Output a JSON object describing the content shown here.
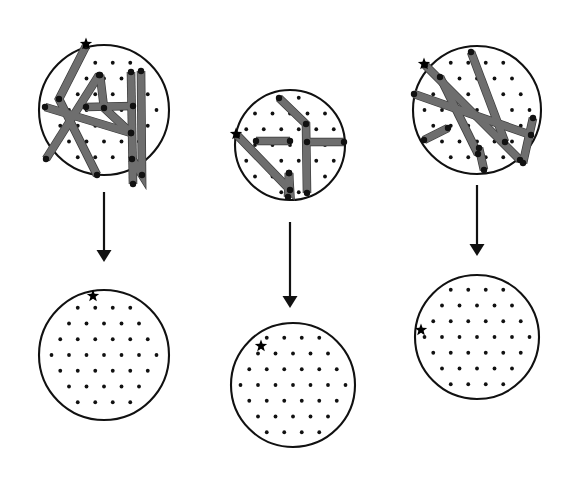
{
  "figure": {
    "title": "",
    "type": "diagram",
    "background_color": "#ffffff",
    "line_color": "#6e6e6e",
    "line_edge_color": "#3a3a3a",
    "dot_color": "#111111",
    "outline_color": "#111111",
    "star_color": "#000000"
  },
  "columns": [
    {
      "name": "column-1",
      "top": {
        "name": "panel-top-left",
        "circle": {
          "cx": 104,
          "cy": 110,
          "r": 65
        },
        "lattice": {
          "spacing": 17.5,
          "row_offset": 8.75,
          "dot_radius": 1.9,
          "origin_x": 104,
          "origin_y": 110
        },
        "star": {
          "x": 86,
          "y": 44,
          "size": 13
        },
        "paths": [
          {
            "name": "path-a",
            "points": [
              [
                86,
                46
              ],
              [
                59,
                99
              ],
              [
                97,
                175
              ]
            ]
          },
          {
            "name": "path-b",
            "points": [
              [
                45,
                107
              ],
              [
                131,
                133
              ]
            ]
          },
          {
            "name": "path-c",
            "points": [
              [
                46,
                159
              ],
              [
                99,
                75
              ]
            ]
          },
          {
            "name": "path-d",
            "points": [
              [
                100,
                75
              ],
              [
                104,
                108
              ],
              [
                131,
                133
              ]
            ]
          },
          {
            "name": "path-e",
            "points": [
              [
                131,
                72
              ],
              [
                133,
                184
              ]
            ]
          },
          {
            "name": "path-f",
            "points": [
              [
                133,
                106
              ],
              [
                86,
                107
              ]
            ]
          },
          {
            "name": "path-g",
            "points": [
              [
                132,
                159
              ],
              [
                142,
                175
              ],
              [
                141,
                71
              ]
            ]
          }
        ]
      },
      "arrow": {
        "name": "arrow-1",
        "x": 104,
        "y1": 192,
        "y2": 262
      },
      "bottom": {
        "name": "panel-bottom-left",
        "circle": {
          "cx": 104,
          "cy": 355,
          "r": 65
        },
        "lattice": {
          "spacing": 17.5,
          "row_offset": 8.75,
          "dot_radius": 1.9,
          "origin_x": 104,
          "origin_y": 355
        },
        "star": {
          "x": 93,
          "y": 296,
          "size": 13
        }
      }
    },
    {
      "name": "column-2",
      "top": {
        "name": "panel-top-middle",
        "circle": {
          "cx": 290,
          "cy": 145,
          "r": 55
        },
        "lattice": {
          "spacing": 17.5,
          "row_offset": 8.75,
          "dot_radius": 1.9,
          "origin_x": 290,
          "origin_y": 145
        },
        "star": {
          "x": 236,
          "y": 134,
          "size": 13
        },
        "paths": [
          {
            "name": "path-a",
            "points": [
              [
                237,
                135
              ],
              [
                290,
                190
              ],
              [
                289,
                173
              ]
            ]
          },
          {
            "name": "path-b",
            "points": [
              [
                289,
                173
              ],
              [
                288,
                197
              ]
            ]
          },
          {
            "name": "path-c",
            "points": [
              [
                256,
                141
              ],
              [
                290,
                141
              ]
            ]
          },
          {
            "name": "path-d",
            "points": [
              [
                279,
                98
              ],
              [
                306,
                124
              ],
              [
                307,
                193
              ]
            ]
          },
          {
            "name": "path-e",
            "points": [
              [
                307,
                142
              ],
              [
                344,
                142
              ]
            ]
          }
        ]
      },
      "arrow": {
        "name": "arrow-2",
        "x": 290,
        "y1": 222,
        "y2": 308
      },
      "bottom": {
        "name": "panel-bottom-middle",
        "circle": {
          "cx": 293,
          "cy": 385,
          "r": 62
        },
        "lattice": {
          "spacing": 17.5,
          "row_offset": 8.75,
          "dot_radius": 1.9,
          "origin_x": 293,
          "origin_y": 385
        },
        "star": {
          "x": 261,
          "y": 346,
          "size": 13
        }
      }
    },
    {
      "name": "column-3",
      "top": {
        "name": "panel-top-right",
        "circle": {
          "cx": 477,
          "cy": 110,
          "r": 64
        },
        "lattice": {
          "spacing": 17.5,
          "row_offset": 8.75,
          "dot_radius": 1.9,
          "origin_x": 477,
          "origin_y": 110
        },
        "star": {
          "x": 424,
          "y": 64,
          "size": 13
        },
        "paths": [
          {
            "name": "path-a",
            "points": [
              [
                425,
                65
              ],
              [
                520,
                160
              ]
            ]
          },
          {
            "name": "path-b",
            "points": [
              [
                471,
                52
              ],
              [
                505,
                142
              ]
            ]
          },
          {
            "name": "path-c",
            "points": [
              [
                414,
                94
              ],
              [
                531,
                135
              ]
            ]
          },
          {
            "name": "path-d",
            "points": [
              [
                440,
                77
              ],
              [
                478,
                154
              ]
            ]
          },
          {
            "name": "path-e",
            "points": [
              [
                533,
                118
              ],
              [
                523,
                163
              ]
            ]
          },
          {
            "name": "path-f",
            "points": [
              [
                424,
                140
              ],
              [
                448,
                128
              ]
            ]
          },
          {
            "name": "path-g",
            "points": [
              [
                479,
                148
              ],
              [
                484,
                170
              ]
            ]
          }
        ]
      },
      "arrow": {
        "name": "arrow-3",
        "x": 477,
        "y1": 185,
        "y2": 256
      },
      "bottom": {
        "name": "panel-bottom-right",
        "circle": {
          "cx": 477,
          "cy": 337,
          "r": 62
        },
        "lattice": {
          "spacing": 17.5,
          "row_offset": 8.75,
          "dot_radius": 1.9,
          "origin_x": 477,
          "origin_y": 337
        },
        "star": {
          "x": 421,
          "y": 330,
          "size": 13
        }
      }
    }
  ],
  "chart_data": {
    "type": "diagram",
    "title": "",
    "panels": [
      {
        "id": "top-left",
        "role": "before",
        "n_segments": 7,
        "has_star": true,
        "lattice": "hexagonal-dot"
      },
      {
        "id": "top-middle",
        "role": "before",
        "n_segments": 5,
        "has_star": true,
        "lattice": "hexagonal-dot"
      },
      {
        "id": "top-right",
        "role": "before",
        "n_segments": 7,
        "has_star": true,
        "lattice": "hexagonal-dot"
      },
      {
        "id": "bottom-left",
        "role": "after",
        "n_segments": 0,
        "has_star": true,
        "lattice": "hexagonal-dot"
      },
      {
        "id": "bottom-middle",
        "role": "after",
        "n_segments": 0,
        "has_star": true,
        "lattice": "hexagonal-dot"
      },
      {
        "id": "bottom-right",
        "role": "after",
        "n_segments": 0,
        "has_star": true,
        "lattice": "hexagonal-dot"
      }
    ],
    "arrows": [
      {
        "from": "top-left",
        "to": "bottom-left",
        "direction": "down"
      },
      {
        "from": "top-middle",
        "to": "bottom-middle",
        "direction": "down"
      },
      {
        "from": "top-right",
        "to": "bottom-right",
        "direction": "down"
      }
    ]
  }
}
